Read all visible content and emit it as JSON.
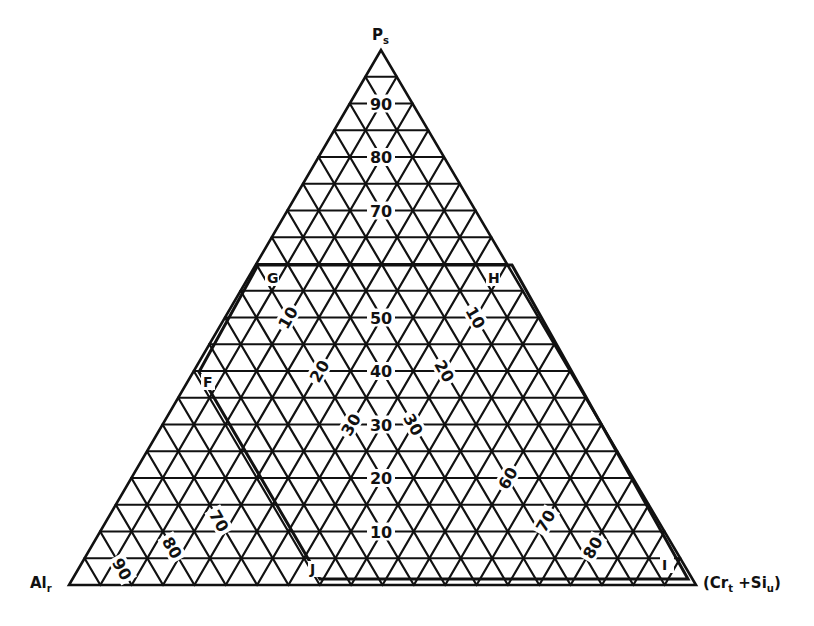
{
  "diagram": {
    "type": "ternary",
    "vertices": {
      "top": {
        "label": "P",
        "sub": "s",
        "x": 381,
        "y": 50
      },
      "left": {
        "label": "Al",
        "sub": "r",
        "x": 69,
        "y": 585
      },
      "right": {
        "label": "(Cr",
        "sub": "t",
        "suffix": " +Si",
        "sub2": "u",
        "close": ")",
        "x": 696,
        "y": 585
      }
    },
    "divisions": 20,
    "line_color": "#111111",
    "background": "#ffffff",
    "ps_axis_labels": [
      "10",
      "20",
      "30",
      "40",
      "50",
      "60",
      "70",
      "80",
      "90"
    ],
    "ps_axis_labels_shown": [
      {
        "text": "90",
        "value": 90
      },
      {
        "text": "80",
        "value": 80
      },
      {
        "text": "70",
        "value": 70
      },
      {
        "text": "50",
        "value": 50
      },
      {
        "text": "40",
        "value": 40
      },
      {
        "text": "30",
        "value": 30
      },
      {
        "text": "20",
        "value": 20
      },
      {
        "text": "10",
        "value": 10
      }
    ],
    "al_axis_labels": [
      {
        "text": "10",
        "al": 10,
        "ps": 50
      },
      {
        "text": "20",
        "al": 20,
        "ps": 40
      },
      {
        "text": "30",
        "al": 30,
        "ps": 30
      },
      {
        "text": "70",
        "al": 70,
        "ps": 12
      },
      {
        "text": "80",
        "al": 80,
        "ps": 7
      },
      {
        "text": "90",
        "al": 90,
        "ps": 3
      }
    ],
    "cr_axis_labels": [
      {
        "text": "10",
        "cr": 10,
        "ps": 50
      },
      {
        "text": "20",
        "cr": 20,
        "ps": 40
      },
      {
        "text": "30",
        "cr": 30,
        "ps": 30
      },
      {
        "text": "60",
        "cr": 60,
        "ps": 20
      },
      {
        "text": "70",
        "cr": 70,
        "ps": 12
      },
      {
        "text": "80",
        "cr": 80,
        "ps": 7
      }
    ],
    "region": {
      "points": [
        {
          "label": "G",
          "x": 258,
          "y": 265,
          "lx": 267,
          "ly": 283
        },
        {
          "label": "H",
          "x": 512,
          "y": 265,
          "lx": 488,
          "ly": 283
        },
        {
          "label": "I",
          "x": 688,
          "y": 579,
          "lx": 662,
          "ly": 570
        },
        {
          "label": "J",
          "x": 320,
          "y": 579,
          "lx": 310,
          "ly": 574
        },
        {
          "label": "F",
          "x": 199,
          "y": 372,
          "lx": 203,
          "ly": 387
        }
      ]
    }
  }
}
